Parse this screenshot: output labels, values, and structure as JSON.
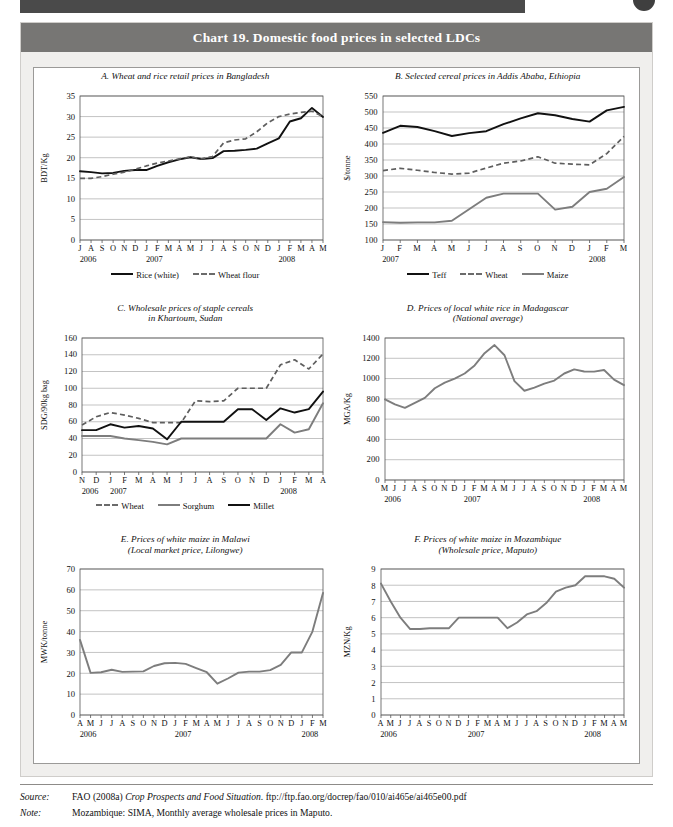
{
  "header": {
    "running_bar": "",
    "page_dot": ""
  },
  "chart_box": {
    "title": "Chart 19.  Domestic food prices in selected LDCs"
  },
  "notes": {
    "source_key": "Source:",
    "source_value_a": "FAO (2008a) ",
    "source_value_italic": "Crop Prospects and Food Situation",
    "source_value_b": ". ftp://ftp.fao.org/docrep/fao/010/ai465e/ai465e00.pdf",
    "note_key": "Note:",
    "note_value": "Mozambique: SIMA, Monthly average wholesale prices in Maputo."
  },
  "chart_data": [
    {
      "id": "A",
      "type": "line",
      "title": "A.  Wheat and rice retail prices in Bangladesh",
      "subtitle": "",
      "ylabel": "BDT/Kg",
      "xlabel": "",
      "ylim": [
        0,
        35
      ],
      "yticks": [
        0,
        5,
        10,
        15,
        20,
        25,
        30,
        35
      ],
      "grid": true,
      "legend_position": "bottom",
      "categories": [
        "J",
        "A",
        "S",
        "O",
        "N",
        "D",
        "J",
        "F",
        "M",
        "A",
        "M",
        "J",
        "J",
        "A",
        "S",
        "O",
        "N",
        "D",
        "J",
        "F",
        "M",
        "A",
        "M"
      ],
      "year_labels": [
        {
          "label": "2006",
          "index": 0
        },
        {
          "label": "2007",
          "index": 6
        },
        {
          "label": "2008",
          "index": 18
        }
      ],
      "series": [
        {
          "name": "Rice (white)",
          "style": "solid-dark",
          "values": [
            16.7,
            16.5,
            16.2,
            16.3,
            16.8,
            17.0,
            17.0,
            18.0,
            18.9,
            19.6,
            20.1,
            19.7,
            19.9,
            21.6,
            21.7,
            21.9,
            22.2,
            23.5,
            24.7,
            28.8,
            29.6,
            32.1,
            29.9
          ]
        },
        {
          "name": "Wheat flour",
          "style": "dash",
          "values": [
            15.0,
            15.0,
            15.4,
            16.0,
            16.5,
            17.2,
            18.0,
            18.7,
            19.2,
            19.7,
            20.2,
            19.7,
            20.3,
            23.6,
            24.3,
            24.6,
            26.3,
            28.5,
            30.0,
            30.6,
            31.0,
            31.3,
            30.0
          ]
        }
      ]
    },
    {
      "id": "B",
      "type": "line",
      "title": "B.  Selected cereal prices in Addis Ababa, Ethiopia",
      "subtitle": "",
      "ylabel": "$/tonne",
      "xlabel": "",
      "ylim": [
        100,
        550
      ],
      "yticks": [
        100,
        150,
        200,
        250,
        300,
        350,
        400,
        450,
        500,
        550
      ],
      "grid": true,
      "legend_position": "bottom",
      "categories": [
        "J",
        "F",
        "M",
        "A",
        "M",
        "J",
        "J",
        "A",
        "S",
        "O",
        "N",
        "D",
        "J",
        "F",
        "M"
      ],
      "year_labels": [
        {
          "label": "2007",
          "index": 0
        },
        {
          "label": "2008",
          "index": 12
        }
      ],
      "series": [
        {
          "name": "Teff",
          "style": "solid-dark",
          "values": [
            435,
            457,
            453,
            440,
            425,
            434,
            440,
            462,
            480,
            496,
            490,
            478,
            470,
            505,
            516
          ]
        },
        {
          "name": "Wheat",
          "style": "dash",
          "values": [
            317,
            324,
            318,
            311,
            306,
            309,
            325,
            340,
            347,
            360,
            340,
            337,
            335,
            370,
            424
          ]
        },
        {
          "name": "Maize",
          "style": "solid-grey",
          "values": [
            156,
            154,
            155,
            155,
            160,
            196,
            232,
            245,
            245,
            245,
            195,
            204,
            250,
            260,
            297
          ]
        }
      ]
    },
    {
      "id": "C",
      "type": "line",
      "title": "C.  Wholesale prices of staple cereals",
      "subtitle": "in Khartoum, Sudan",
      "ylabel": "SDG/90kg bag",
      "xlabel": "",
      "ylim": [
        0,
        160
      ],
      "yticks": [
        0,
        20,
        40,
        60,
        80,
        100,
        120,
        140,
        160
      ],
      "grid": true,
      "legend_position": "bottom",
      "categories": [
        "N",
        "D",
        "J",
        "F",
        "M",
        "A",
        "M",
        "J",
        "J",
        "A",
        "S",
        "O",
        "N",
        "D",
        "J",
        "F",
        "M",
        "A"
      ],
      "year_labels": [
        {
          "label": "2006",
          "index": 0
        },
        {
          "label": "2007",
          "index": 2
        },
        {
          "label": "2008",
          "index": 14
        }
      ],
      "series": [
        {
          "name": "Wheat",
          "style": "dash",
          "values": [
            56,
            66,
            71,
            68,
            64,
            59,
            59,
            59,
            85,
            84,
            85,
            100,
            100,
            100,
            128,
            134,
            123,
            141
          ]
        },
        {
          "name": "Sorghum",
          "style": "solid-grey",
          "values": [
            43,
            43,
            43,
            40,
            38,
            36,
            33,
            40,
            40,
            40,
            40,
            40,
            40,
            40,
            57,
            47,
            51,
            82
          ]
        },
        {
          "name": "Millet",
          "style": "solid-dark",
          "values": [
            50,
            50,
            57,
            53,
            55,
            52,
            39,
            60,
            60,
            60,
            60,
            75,
            75,
            62,
            76,
            71,
            75,
            96
          ]
        }
      ]
    },
    {
      "id": "D",
      "type": "line",
      "title": "D.  Prices of  local white rice in Madagascar",
      "subtitle": "(National average)",
      "ylabel": "MGA/Kg",
      "xlabel": "",
      "ylim": [
        0,
        1400
      ],
      "yticks": [
        0,
        200,
        400,
        600,
        800,
        1000,
        1200,
        1400
      ],
      "grid": true,
      "legend_position": "none",
      "categories": [
        "M",
        "J",
        "J",
        "A",
        "S",
        "O",
        "N",
        "D",
        "J",
        "F",
        "M",
        "A",
        "M",
        "J",
        "J",
        "A",
        "S",
        "O",
        "N",
        "D",
        "J",
        "F",
        "M",
        "A",
        "M"
      ],
      "year_labels": [
        {
          "label": "2006",
          "index": 0
        },
        {
          "label": "2007",
          "index": 8
        },
        {
          "label": "2008",
          "index": 20
        }
      ],
      "series": [
        {
          "name": "Local white rice",
          "style": "solid-grey",
          "values": [
            795,
            745,
            712,
            760,
            810,
            905,
            960,
            1000,
            1050,
            1130,
            1250,
            1330,
            1230,
            975,
            880,
            910,
            950,
            980,
            1050,
            1090,
            1070,
            1068,
            1085,
            990,
            935
          ]
        }
      ]
    },
    {
      "id": "E",
      "type": "line",
      "title": "E.  Prices of white maize in Malawi",
      "subtitle": "(Local market price, Lilongwe)",
      "ylabel": "MWK/tonne",
      "xlabel": "",
      "ylim": [
        0,
        70
      ],
      "yticks": [
        0,
        10,
        20,
        30,
        40,
        50,
        60,
        70
      ],
      "grid": true,
      "legend_position": "none",
      "categories": [
        "A",
        "M",
        "J",
        "J",
        "A",
        "S",
        "O",
        "N",
        "D",
        "J",
        "F",
        "M",
        "A",
        "M",
        "J",
        "J",
        "A",
        "S",
        "O",
        "N",
        "D",
        "J",
        "F",
        "M"
      ],
      "year_labels": [
        {
          "label": "2006",
          "index": 0
        },
        {
          "label": "2007",
          "index": 9
        },
        {
          "label": "2008",
          "index": 21
        }
      ],
      "series": [
        {
          "name": "White maize",
          "style": "solid-grey",
          "values": [
            36,
            20.2,
            20.5,
            21.7,
            20.7,
            20.8,
            20.9,
            23.5,
            24.8,
            25,
            24.5,
            22.5,
            20.5,
            15,
            17.5,
            20.3,
            20.8,
            20.8,
            21.5,
            24,
            30,
            30,
            40,
            58.5
          ]
        }
      ]
    },
    {
      "id": "F",
      "type": "line",
      "title": "F.  Prices of white maize in Mozambique",
      "subtitle": "(Wholesale price, Maputo)",
      "ylabel": "MZN/Kg",
      "xlabel": "",
      "ylim": [
        0,
        9
      ],
      "yticks": [
        0,
        1,
        2,
        3,
        4,
        5,
        6,
        7,
        8,
        9
      ],
      "grid": true,
      "legend_position": "none",
      "categories": [
        "A",
        "M",
        "J",
        "J",
        "A",
        "S",
        "O",
        "N",
        "D",
        "J",
        "F",
        "M",
        "A",
        "M",
        "J",
        "J",
        "A",
        "S",
        "O",
        "N",
        "D",
        "J",
        "F",
        "M",
        "A",
        "M"
      ],
      "year_labels": [
        {
          "label": "2006",
          "index": 0
        },
        {
          "label": "2007",
          "index": 9
        },
        {
          "label": "2008",
          "index": 21
        }
      ],
      "series": [
        {
          "name": "White maize",
          "style": "solid-grey",
          "values": [
            8.1,
            7.0,
            6.0,
            5.3,
            5.3,
            5.35,
            5.35,
            5.35,
            6.0,
            6.0,
            6.0,
            6.0,
            6.0,
            5.35,
            5.7,
            6.2,
            6.4,
            6.9,
            7.6,
            7.85,
            8.0,
            8.55,
            8.55,
            8.55,
            8.4,
            7.85
          ]
        }
      ]
    }
  ]
}
